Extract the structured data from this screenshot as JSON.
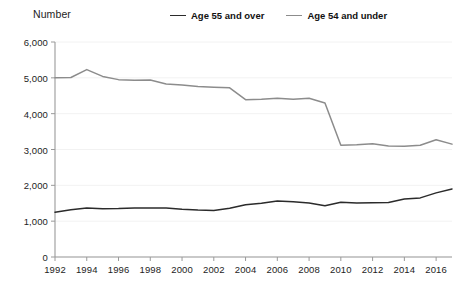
{
  "chart_data": {
    "type": "line",
    "title": "",
    "ylabel": "Number",
    "xlabel": "",
    "ylim": [
      0,
      6000
    ],
    "xlim": [
      1992,
      2017
    ],
    "grid": true,
    "legend_position": "top",
    "ytick_labels": [
      "6,000",
      "5,000",
      "4,000",
      "3,000",
      "2,000",
      "1,000",
      "0"
    ],
    "ytick_values": [
      6000,
      5000,
      4000,
      3000,
      2000,
      1000,
      0
    ],
    "xtick_labels": [
      "1992",
      "1994",
      "1996",
      "1998",
      "2000",
      "2002",
      "2004",
      "2006",
      "2008",
      "2010",
      "2012",
      "2014",
      "2016"
    ],
    "xtick_values": [
      1992,
      1994,
      1996,
      1998,
      2000,
      2002,
      2004,
      2006,
      2008,
      2010,
      2012,
      2014,
      2016
    ],
    "x": [
      1992,
      1993,
      1994,
      1995,
      1996,
      1997,
      1998,
      1999,
      2000,
      2001,
      2002,
      2003,
      2004,
      2005,
      2006,
      2007,
      2008,
      2009,
      2010,
      2011,
      2012,
      2013,
      2014,
      2015,
      2016,
      2017
    ],
    "series": [
      {
        "name": "Age 55 and over",
        "color": "#2b2b2b",
        "values": [
          1250,
          1320,
          1370,
          1350,
          1355,
          1370,
          1370,
          1365,
          1330,
          1310,
          1300,
          1360,
          1460,
          1500,
          1560,
          1540,
          1510,
          1430,
          1530,
          1510,
          1515,
          1520,
          1620,
          1650,
          1790,
          1900
        ]
      },
      {
        "name": "Age 54 and under",
        "color": "#8c8c8c",
        "values": [
          5000,
          5010,
          5230,
          5040,
          4950,
          4930,
          4940,
          4830,
          4800,
          4760,
          4740,
          4720,
          4390,
          4400,
          4430,
          4400,
          4430,
          4300,
          3120,
          3130,
          3160,
          3100,
          3090,
          3120,
          3270,
          3150
        ]
      }
    ]
  },
  "legend": {
    "items": [
      {
        "label": "Age 55 and over",
        "color": "#2b2b2b"
      },
      {
        "label": "Age 54 and under",
        "color": "#8c8c8c"
      }
    ]
  },
  "colors": {
    "series_over": "#2b2b2b",
    "series_under": "#8c8c8c",
    "axis": "#9a9a9a",
    "grid": "#f2f2f2",
    "text": "#1d1d1d",
    "background": "#ffffff"
  }
}
